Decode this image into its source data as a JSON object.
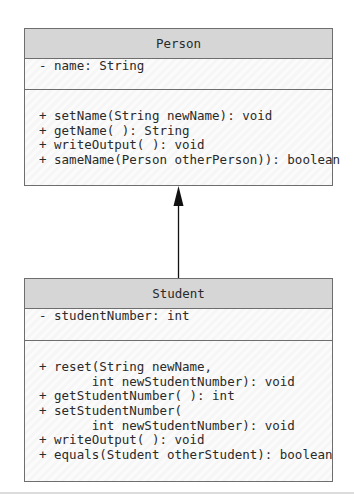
{
  "diagram": {
    "type": "UML class diagram (inheritance)",
    "classes": [
      {
        "name": "Person",
        "attributes": [
          "- name: String"
        ],
        "methods": [
          "+ setName(String newName): void",
          "+ getName( ): String",
          "+ writeOutput( ): void",
          "+ sameName(Person otherPerson)): boolean"
        ]
      },
      {
        "name": "Student",
        "attributes": [
          "- studentNumber: int"
        ],
        "methods": [
          "+ reset(String newName,",
          "       int newStudentNumber): void",
          "+ getStudentNumber( ): int",
          "+ setStudentNumber(",
          "       int newStudentNumber): void",
          "+ writeOutput( ): void",
          "+ equals(Student otherStudent): boolean"
        ]
      }
    ],
    "relationship": {
      "from": "Student",
      "to": "Person",
      "kind": "inheritance-arrow"
    },
    "colors": {
      "header_fill": "#d6d6d6",
      "body_fill": "#f8f8f8",
      "border": "#6e6e6e",
      "arrow": "#111111"
    }
  }
}
